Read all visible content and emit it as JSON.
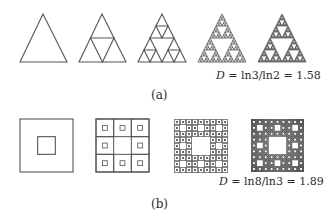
{
  "colors": {
    "stroke": "#555555",
    "fill_dark": "#3a3a3a",
    "background": "#ffffff"
  },
  "panel_a": {
    "caption": "(a)",
    "title": "Sierpinski triangle iterations",
    "formula": {
      "variable": "D",
      "expression": " = ln3/ln2 = 1.58"
    },
    "iterations": [
      {
        "level": 0,
        "apex": [
          43,
          14
        ],
        "base_left": [
          20,
          62
        ],
        "base_right": [
          67,
          62
        ]
      },
      {
        "level": 1,
        "apex": [
          102,
          14
        ],
        "base_left": [
          79,
          62
        ],
        "base_right": [
          126,
          62
        ]
      },
      {
        "level": 2,
        "apex": [
          162,
          14
        ],
        "base_left": [
          138,
          62
        ],
        "base_right": [
          186,
          62
        ]
      },
      {
        "level": 4,
        "apex": [
          222,
          14
        ],
        "base_left": [
          198,
          62
        ],
        "base_right": [
          246,
          62
        ]
      },
      {
        "level": 5,
        "apex": [
          282,
          14
        ],
        "base_left": [
          258,
          62
        ],
        "base_right": [
          306,
          62
        ]
      }
    ]
  },
  "panel_b": {
    "caption": "(b)",
    "title": "Sierpinski carpet iterations",
    "formula": {
      "variable": "D",
      "expression": " = ln8/ln3 = 1.89"
    },
    "iterations": [
      {
        "level": 1,
        "x": 20,
        "y": 119,
        "size": 53
      },
      {
        "level": 2,
        "x": 96,
        "y": 119,
        "size": 53
      },
      {
        "level": 3,
        "x": 174,
        "y": 119,
        "size": 54
      },
      {
        "level": 4,
        "x": 251,
        "y": 119,
        "size": 53
      }
    ]
  }
}
